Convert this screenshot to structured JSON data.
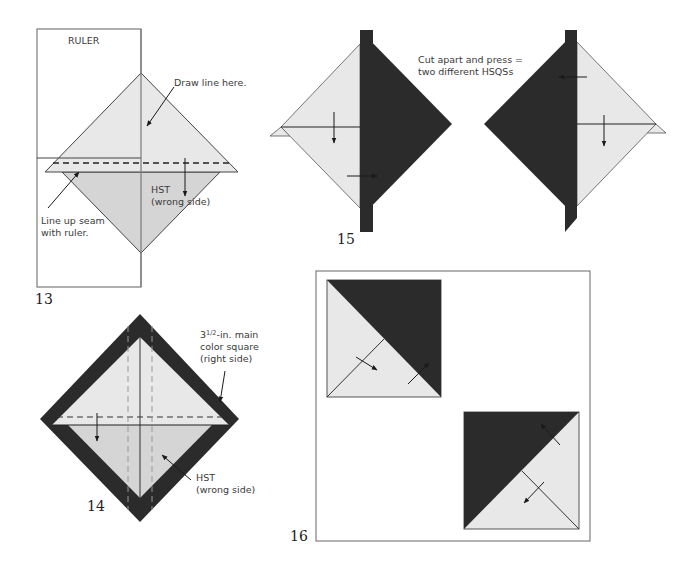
{
  "colors": {
    "light_fabric": "#e8e8e8",
    "mid_fabric": "#d5d5d5",
    "dark_fabric": "#2b2b2b",
    "outline": "#555555",
    "arrow": "#1a1a1a"
  },
  "step13": {
    "number": "13",
    "ruler_label": "RULER",
    "callout_draw_line": "Draw line here.",
    "callout_seam_line1": "Line up seam",
    "callout_seam_line2": "with ruler.",
    "hst_label_line1": "HST",
    "hst_label_line2": "(wrong side)"
  },
  "step14": {
    "number": "14",
    "square_label_whole": "3",
    "square_label_fraction": "1/2",
    "square_label_line1_rest": "-in. main",
    "square_label_line2": "color square",
    "square_label_line3": "(right side)",
    "hst_label_line1": "HST",
    "hst_label_line2": "(wrong side)"
  },
  "step15": {
    "number": "15",
    "caption_line1": "Cut apart and press =",
    "caption_line2": "two different HSQSs"
  },
  "step16": {
    "number": "16"
  }
}
